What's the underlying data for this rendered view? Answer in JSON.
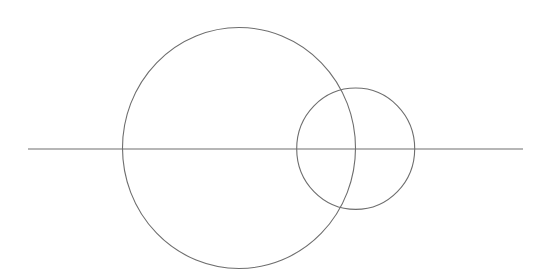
{
  "canvas": {
    "width": 547,
    "height": 279,
    "background": "#ffffff"
  },
  "style": {
    "stroke": "#6e6e6e",
    "stroke_width": 1.1
  },
  "shapes": {
    "baseline": {
      "x1": 28,
      "y1": 149,
      "x2": 523,
      "y2": 149
    },
    "large_circle": {
      "cx": 239,
      "cy": 148,
      "rx": 116.5,
      "ry": 120.5
    },
    "small_circle": {
      "cx": 355.7,
      "cy": 148.7,
      "rx": 59,
      "ry": 60.7
    }
  }
}
